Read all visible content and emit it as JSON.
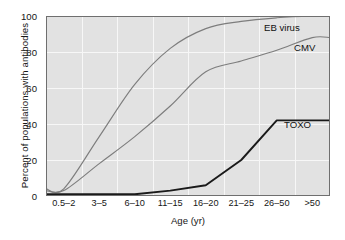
{
  "chart_data": {
    "type": "line",
    "title": "",
    "xlabel": "Age (yr)",
    "ylabel": "Percent of populations with antibodies",
    "categories": [
      "0.5–2",
      "3–5",
      "6–10",
      "11–15",
      "16–20",
      "21–25",
      "26–50",
      ">50"
    ],
    "ylim": [
      0,
      100
    ],
    "yticks": [
      0,
      20,
      40,
      60,
      80,
      100
    ],
    "grid": true,
    "legend_position": "inline-right",
    "series": [
      {
        "name": "EB virus",
        "color": "#7d7d7d",
        "values": [
          4,
          33,
          62,
          82,
          93,
          97,
          99,
          100
        ]
      },
      {
        "name": "CMV",
        "color": "#7d7d7d",
        "values": [
          3,
          18,
          33,
          50,
          69,
          75,
          81,
          88
        ]
      },
      {
        "name": "TOXO",
        "color": "#1a1a1a",
        "values": [
          1,
          1,
          1,
          3,
          6,
          20,
          42,
          42
        ]
      }
    ]
  },
  "axis": {
    "ytick_labels": [
      "0",
      "20",
      "40",
      "60",
      "80",
      "100"
    ],
    "xtick_labels": [
      "0.5–2",
      "3–5",
      "6–10",
      "11–15",
      "16–20",
      "21–25",
      "26–50",
      ">50"
    ]
  },
  "labels": {
    "eb_virus": "EB virus",
    "cmv": "CMV",
    "toxo": "TOXO"
  },
  "colors": {
    "plot_background": "#e2e2e2",
    "gridline": "#f7f7f7",
    "axis_border": "#6f6f6f",
    "series_gray": "#7d7d7d",
    "series_black": "#1a1a1a",
    "page_background": "#ffffff"
  }
}
